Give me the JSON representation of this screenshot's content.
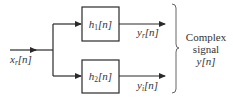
{
  "diagram": {
    "type": "block-diagram",
    "input": {
      "symbol": "x",
      "subscript": "r",
      "arg": "[n]"
    },
    "blocks": [
      {
        "id": "h1",
        "symbol": "h",
        "subscript": "1",
        "arg": "[n]"
      },
      {
        "id": "h2",
        "symbol": "h",
        "subscript": "2",
        "arg": "[n]"
      }
    ],
    "outputs": [
      {
        "symbol": "y",
        "subscript": "r",
        "arg": "[n]"
      },
      {
        "symbol": "y",
        "subscript": "i",
        "arg": "[n]"
      }
    ],
    "group_label": {
      "line1": "Complex",
      "line2": "signal",
      "line3_symbol": "y",
      "line3_arg": "[n]"
    },
    "edges": [
      {
        "from": "input",
        "to": "h1"
      },
      {
        "from": "input",
        "to": "h2"
      },
      {
        "from": "h1",
        "to": "output-yr"
      },
      {
        "from": "h2",
        "to": "output-yi"
      }
    ]
  }
}
